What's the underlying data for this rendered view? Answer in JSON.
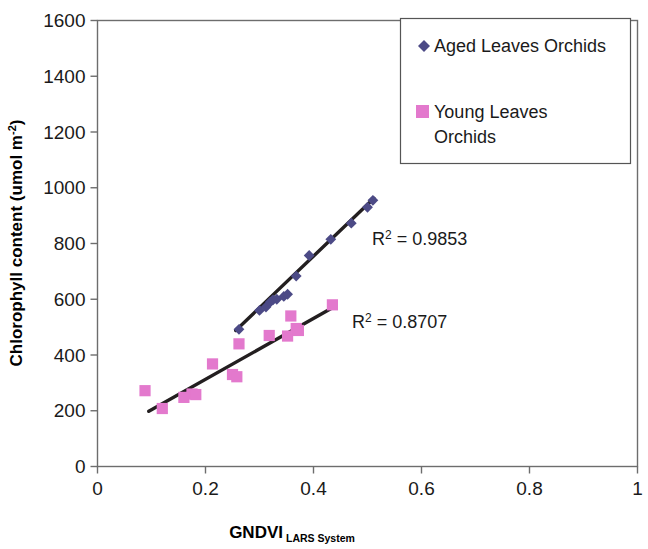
{
  "chart_data": {
    "type": "scatter",
    "title": "",
    "xlabel": "GNDVI",
    "xlabel_subscript": "LARS System",
    "ylabel": "Chlorophyll content (umol m",
    "ylabel_exponent": "-2",
    "ylabel_suffix": ")",
    "xlim": [
      0,
      1
    ],
    "ylim": [
      0,
      1600
    ],
    "xticks": [
      "0",
      "0.2",
      "0.4",
      "0.6",
      "0.8",
      "1"
    ],
    "xtick_values": [
      0,
      0.2,
      0.4,
      0.6,
      0.8,
      1
    ],
    "yticks": [
      "0",
      "200",
      "400",
      "600",
      "800",
      "1000",
      "1200",
      "1400",
      "1600"
    ],
    "ytick_values": [
      0,
      200,
      400,
      600,
      800,
      1000,
      1200,
      1400,
      1600
    ],
    "grid": false,
    "legend_position": "top-right",
    "series": [
      {
        "name": "Aged Leaves Orchids",
        "marker": "diamond",
        "color": "#4c4a86",
        "points": [
          [
            0.262,
            492
          ],
          [
            0.3,
            560
          ],
          [
            0.312,
            572
          ],
          [
            0.32,
            590
          ],
          [
            0.325,
            598
          ],
          [
            0.332,
            600
          ],
          [
            0.345,
            610
          ],
          [
            0.352,
            618
          ],
          [
            0.368,
            683
          ],
          [
            0.392,
            757
          ],
          [
            0.432,
            815
          ],
          [
            0.47,
            873
          ],
          [
            0.5,
            930
          ],
          [
            0.51,
            955
          ]
        ],
        "trendline": {
          "x1": 0.256,
          "y1": 488,
          "x2": 0.512,
          "y2": 962
        },
        "r_squared_label": "R",
        "r_squared_sup": "2",
        "r_squared_value": " = 0.9853"
      },
      {
        "name": "Young Leaves Orchids",
        "marker": "square",
        "color": "#e379cd",
        "points": [
          [
            0.088,
            272
          ],
          [
            0.12,
            208
          ],
          [
            0.16,
            248
          ],
          [
            0.175,
            260
          ],
          [
            0.182,
            258
          ],
          [
            0.213,
            368
          ],
          [
            0.25,
            330
          ],
          [
            0.258,
            322
          ],
          [
            0.262,
            440
          ],
          [
            0.318,
            470
          ],
          [
            0.352,
            468
          ],
          [
            0.358,
            540
          ],
          [
            0.368,
            495
          ],
          [
            0.372,
            488
          ],
          [
            0.435,
            580
          ]
        ],
        "trendline": {
          "x1": 0.095,
          "y1": 198,
          "x2": 0.44,
          "y2": 575
        },
        "r_squared_label": "R",
        "r_squared_sup": "2",
        "r_squared_value": " = 0.8707"
      }
    ]
  },
  "legend": {
    "entries": [
      {
        "label": "Aged Leaves Orchids",
        "label_line2": "",
        "marker": "diamond",
        "color": "#4c4a86"
      },
      {
        "label": "Young Leaves",
        "label_line2": "Orchids",
        "marker": "square",
        "color": "#e379cd"
      }
    ]
  },
  "colors": {
    "aged": "#4c4a86",
    "young": "#e379cd",
    "trend": "#231f20",
    "axis": "#6d6d6d",
    "text": "#1a1a1a"
  }
}
